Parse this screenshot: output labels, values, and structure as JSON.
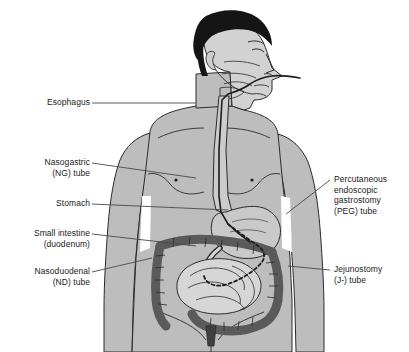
{
  "figure": {
    "view": "anterior torso with head in right profile"
  },
  "colors": {
    "background": "#ffffff",
    "skin": "#bdbdbd",
    "skin_light": "#cfcfcf",
    "face": "#d2d2d2",
    "hair": "#151515",
    "outline": "#2b2b2b",
    "colon": "#5a5a5a",
    "small_intestine": "#d6d6d6",
    "stomach": "#c9c9c9",
    "esophagus": "#cccccc",
    "tube": "#1d1d1d",
    "leader": "#4a4a4a",
    "text": "#1b1b1b",
    "gap_white": "#ffffff"
  },
  "labels": {
    "left": [
      {
        "id": "esophagus",
        "lines": [
          "Esophagus"
        ],
        "x": 18,
        "y": 97,
        "width": 72,
        "leader": {
          "x1": 92,
          "y1": 103,
          "x2": 196,
          "y2": 103
        }
      },
      {
        "id": "nasogastric-tube",
        "lines": [
          "Nasogastric",
          "(NG) tube"
        ],
        "x": 14,
        "y": 157,
        "width": 76,
        "leader": {
          "x1": 92,
          "y1": 163,
          "x2": 196,
          "y2": 178
        }
      },
      {
        "id": "stomach",
        "lines": [
          "Stomach"
        ],
        "x": 18,
        "y": 198,
        "width": 72,
        "leader": {
          "x1": 92,
          "y1": 204,
          "x2": 228,
          "y2": 210
        }
      },
      {
        "id": "small-intestine",
        "lines": [
          "Small intestine",
          "(duodenum)"
        ],
        "x": 4,
        "y": 228,
        "width": 86,
        "leader": {
          "x1": 92,
          "y1": 234,
          "x2": 196,
          "y2": 246
        }
      },
      {
        "id": "nasoduodenal-tube",
        "lines": [
          "Nasoduodenal",
          "(ND) tube"
        ],
        "x": 8,
        "y": 266,
        "width": 82,
        "leader": {
          "x1": 92,
          "y1": 272,
          "x2": 152,
          "y2": 258
        }
      }
    ],
    "right": [
      {
        "id": "peg-tube",
        "lines": [
          "Percutaneous",
          "endoscopic",
          "gastrostomy",
          "(PEG) tube"
        ],
        "x": 334,
        "y": 174,
        "width": 74,
        "leader": {
          "x1": 330,
          "y1": 180,
          "x2": 286,
          "y2": 214
        }
      },
      {
        "id": "jejunostomy-tube",
        "lines": [
          "Jejunostomy",
          "(J-) tube"
        ],
        "x": 334,
        "y": 264,
        "width": 74,
        "leader": {
          "x1": 330,
          "y1": 270,
          "x2": 288,
          "y2": 266
        }
      }
    ]
  },
  "anatomy": [
    {
      "id": "head",
      "name": "head-right-profile"
    },
    {
      "id": "hair",
      "name": "hair"
    },
    {
      "id": "nose",
      "name": "nose"
    },
    {
      "id": "ear",
      "name": "ear"
    },
    {
      "id": "neck",
      "name": "neck"
    },
    {
      "id": "torso",
      "name": "torso"
    },
    {
      "id": "left-arm",
      "name": "left-arm"
    },
    {
      "id": "right-arm",
      "name": "right-arm"
    },
    {
      "id": "nipple-left",
      "name": "nipple-left"
    },
    {
      "id": "nipple-right",
      "name": "nipple-right"
    },
    {
      "id": "esophagus",
      "name": "esophagus"
    },
    {
      "id": "stomach",
      "name": "stomach"
    },
    {
      "id": "duodenum",
      "name": "duodenum"
    },
    {
      "id": "small-intestine",
      "name": "small-intestine-jejunum-ileum"
    },
    {
      "id": "colon",
      "name": "large-intestine-colon"
    },
    {
      "id": "rectum",
      "name": "rectum"
    },
    {
      "id": "ng-tube",
      "name": "nasogastric-tube-path"
    },
    {
      "id": "nd-tube",
      "name": "nasoduodenal-tube-dashed-path"
    }
  ]
}
